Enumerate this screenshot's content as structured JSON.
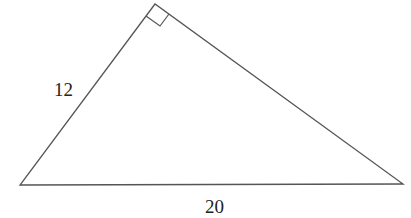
{
  "diagram": {
    "type": "right-triangle",
    "stroke_color": "#555555",
    "vertices": {
      "top": [
        155,
        4
      ],
      "left": [
        20,
        185
      ],
      "right": [
        403,
        184
      ]
    },
    "right_angle_at": "top",
    "labels": {
      "leg": "12",
      "hypotenuse": "20"
    }
  }
}
